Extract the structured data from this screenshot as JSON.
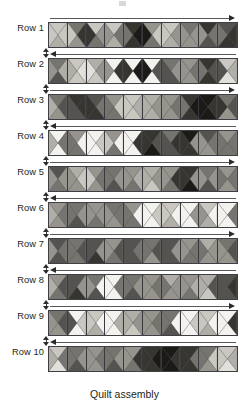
{
  "figure": {
    "caption": "Quilt assembly",
    "rows_count": 10,
    "blocks_per_row": 10,
    "block_type": "quarter-square-triangle-hourglass-x",
    "palette": {
      "white": "#f4f2ee",
      "very_light": "#e2e0da",
      "light": "#c9c7c0",
      "light_mid": "#b0aea7",
      "mid": "#96948d",
      "mid_dark": "#76746f",
      "dark": "#55534f",
      "very_dark": "#37352f",
      "black": "#1b1a17",
      "outline": "#3a3a3e",
      "arrow": "#2b2b2e",
      "text": "#231f20",
      "background": "#ffffff"
    },
    "rows": [
      {
        "label": "Row 1",
        "arrow_direction": "right",
        "blocks": [
          {
            "top": "light",
            "right": "light",
            "bottom": "light_mid",
            "left": "light"
          },
          {
            "top": "mid_dark",
            "right": "very_dark",
            "bottom": "mid",
            "left": "light"
          },
          {
            "top": "light",
            "right": "mid",
            "bottom": "mid_dark",
            "left": "very_dark"
          },
          {
            "top": "light",
            "right": "mid_dark",
            "bottom": "light_mid",
            "left": "mid"
          },
          {
            "top": "very_dark",
            "right": "black",
            "bottom": "very_dark",
            "left": "mid_dark"
          },
          {
            "top": "mid",
            "right": "light",
            "bottom": "mid_dark",
            "left": "black"
          },
          {
            "top": "light",
            "right": "mid",
            "bottom": "light_mid",
            "left": "light"
          },
          {
            "top": "mid_dark",
            "right": "mid",
            "bottom": "mid",
            "left": "mid"
          },
          {
            "top": "very_dark",
            "right": "mid_dark",
            "bottom": "dark",
            "left": "mid"
          },
          {
            "top": "dark",
            "right": "very_dark",
            "bottom": "very_dark",
            "left": "mid_dark"
          }
        ]
      },
      {
        "label": "Row 2",
        "arrow_direction": "left",
        "blocks": [
          {
            "top": "mid_dark",
            "right": "light_mid",
            "bottom": "dark",
            "left": "mid"
          },
          {
            "top": "light",
            "right": "very_light",
            "bottom": "light",
            "left": "light_mid"
          },
          {
            "top": "light_mid",
            "right": "mid",
            "bottom": "light",
            "left": "very_light"
          },
          {
            "top": "white",
            "right": "very_dark",
            "bottom": "white",
            "left": "mid"
          },
          {
            "top": "white",
            "right": "black",
            "bottom": "white",
            "left": "very_dark"
          },
          {
            "top": "white",
            "right": "dark",
            "bottom": "white",
            "left": "black"
          },
          {
            "top": "mid_dark",
            "right": "mid",
            "bottom": "dark",
            "left": "dark"
          },
          {
            "top": "mid",
            "right": "mid_dark",
            "bottom": "mid",
            "left": "mid"
          },
          {
            "top": "very_dark",
            "right": "dark",
            "bottom": "very_dark",
            "left": "mid_dark"
          },
          {
            "top": "light",
            "right": "light_mid",
            "bottom": "very_light",
            "left": "dark"
          }
        ]
      },
      {
        "label": "Row 3",
        "arrow_direction": "right",
        "blocks": [
          {
            "top": "mid_dark",
            "right": "dark",
            "bottom": "mid",
            "left": "light_mid"
          },
          {
            "top": "very_dark",
            "right": "very_dark",
            "bottom": "dark",
            "left": "dark"
          },
          {
            "top": "dark",
            "right": "mid_dark",
            "bottom": "very_dark",
            "left": "very_dark"
          },
          {
            "top": "mid",
            "right": "light",
            "bottom": "mid_dark",
            "left": "mid_dark"
          },
          {
            "top": "light",
            "right": "light_mid",
            "bottom": "light",
            "left": "light"
          },
          {
            "top": "light_mid",
            "right": "mid",
            "bottom": "light_mid",
            "left": "light_mid"
          },
          {
            "top": "mid",
            "right": "mid_dark",
            "bottom": "mid",
            "left": "mid"
          },
          {
            "top": "very_dark",
            "right": "black",
            "bottom": "very_dark",
            "left": "mid_dark"
          },
          {
            "top": "black",
            "right": "very_dark",
            "bottom": "black",
            "left": "black"
          },
          {
            "top": "mid_dark",
            "right": "dark",
            "bottom": "mid",
            "left": "very_dark"
          }
        ]
      },
      {
        "label": "Row 4",
        "arrow_direction": "left",
        "blocks": [
          {
            "top": "white",
            "right": "mid_dark",
            "bottom": "white",
            "left": "light_mid"
          },
          {
            "top": "mid",
            "right": "white",
            "bottom": "mid_dark",
            "left": "mid_dark"
          },
          {
            "top": "white",
            "right": "light",
            "bottom": "white",
            "left": "white"
          },
          {
            "top": "mid",
            "right": "white",
            "bottom": "mid_dark",
            "left": "light"
          },
          {
            "top": "white",
            "right": "very_dark",
            "bottom": "white",
            "left": "white"
          },
          {
            "top": "very_dark",
            "right": "dark",
            "bottom": "black",
            "left": "very_dark"
          },
          {
            "top": "mid_dark",
            "right": "very_dark",
            "bottom": "dark",
            "left": "dark"
          },
          {
            "top": "black",
            "right": "mid",
            "bottom": "very_dark",
            "left": "very_dark"
          },
          {
            "top": "dark",
            "right": "mid_dark",
            "bottom": "mid",
            "left": "mid"
          },
          {
            "top": "mid",
            "right": "mid_dark",
            "bottom": "mid_dark",
            "left": "mid_dark"
          }
        ]
      },
      {
        "label": "Row 5",
        "arrow_direction": "right",
        "blocks": [
          {
            "top": "dark",
            "right": "mid",
            "bottom": "mid_dark",
            "left": "mid"
          },
          {
            "top": "light_mid",
            "right": "light",
            "bottom": "mid",
            "left": "mid"
          },
          {
            "top": "mid",
            "right": "mid_dark",
            "bottom": "mid",
            "left": "light"
          },
          {
            "top": "mid_dark",
            "right": "mid",
            "bottom": "dark",
            "left": "mid_dark"
          },
          {
            "top": "mid",
            "right": "light_mid",
            "bottom": "mid_dark",
            "left": "mid"
          },
          {
            "top": "light_mid",
            "right": "mid",
            "bottom": "light",
            "left": "light_mid"
          },
          {
            "top": "mid",
            "right": "very_dark",
            "bottom": "mid_dark",
            "left": "mid"
          },
          {
            "top": "very_dark",
            "right": "mid",
            "bottom": "black",
            "left": "very_dark"
          },
          {
            "top": "mid_dark",
            "right": "mid",
            "bottom": "dark",
            "left": "mid"
          },
          {
            "top": "mid",
            "right": "mid_dark",
            "bottom": "mid",
            "left": "mid_dark"
          }
        ]
      },
      {
        "label": "Row 6",
        "arrow_direction": "left",
        "blocks": [
          {
            "top": "mid",
            "right": "mid_dark",
            "bottom": "mid",
            "left": "light_mid"
          },
          {
            "top": "mid_dark",
            "right": "mid",
            "bottom": "dark",
            "left": "mid_dark"
          },
          {
            "top": "mid",
            "right": "mid",
            "bottom": "mid_dark",
            "left": "mid"
          },
          {
            "top": "mid_dark",
            "right": "mid_dark",
            "bottom": "mid",
            "left": "mid"
          },
          {
            "top": "mid",
            "right": "white",
            "bottom": "mid_dark",
            "left": "mid_dark"
          },
          {
            "top": "white",
            "right": "light",
            "bottom": "white",
            "left": "white"
          },
          {
            "top": "light",
            "right": "white",
            "bottom": "light_mid",
            "left": "light"
          },
          {
            "top": "white",
            "right": "mid",
            "bottom": "white",
            "left": "white"
          },
          {
            "top": "light",
            "right": "white",
            "bottom": "light_mid",
            "left": "mid"
          },
          {
            "top": "white",
            "right": "mid_dark",
            "bottom": "white",
            "left": "white"
          }
        ]
      },
      {
        "label": "Row 7",
        "arrow_direction": "right",
        "blocks": [
          {
            "top": "dark",
            "right": "mid_dark",
            "bottom": "dark",
            "left": "mid"
          },
          {
            "top": "mid_dark",
            "right": "dark",
            "bottom": "mid_dark",
            "left": "mid_dark"
          },
          {
            "top": "dark",
            "right": "mid",
            "bottom": "very_dark",
            "left": "dark"
          },
          {
            "top": "mid",
            "right": "dark",
            "bottom": "mid_dark",
            "left": "mid"
          },
          {
            "top": "dark",
            "right": "mid_dark",
            "bottom": "dark",
            "left": "dark"
          },
          {
            "top": "mid_dark",
            "right": "dark",
            "bottom": "mid",
            "left": "mid_dark"
          },
          {
            "top": "dark",
            "right": "mid",
            "bottom": "dark",
            "left": "dark"
          },
          {
            "top": "mid",
            "right": "mid_dark",
            "bottom": "mid_dark",
            "left": "mid"
          },
          {
            "top": "light_mid",
            "right": "mid",
            "bottom": "mid",
            "left": "mid_dark"
          },
          {
            "top": "mid_dark",
            "right": "dark",
            "bottom": "mid",
            "left": "mid"
          }
        ]
      },
      {
        "label": "Row 8",
        "arrow_direction": "left",
        "blocks": [
          {
            "top": "mid",
            "right": "dark",
            "bottom": "mid_dark",
            "left": "light_mid"
          },
          {
            "top": "dark",
            "right": "mid",
            "bottom": "very_dark",
            "left": "dark"
          },
          {
            "top": "mid_dark",
            "right": "white",
            "bottom": "dark",
            "left": "mid"
          },
          {
            "top": "white",
            "right": "mid_dark",
            "bottom": "white",
            "left": "white"
          },
          {
            "top": "mid_dark",
            "right": "mid",
            "bottom": "dark",
            "left": "mid_dark"
          },
          {
            "top": "mid",
            "right": "mid_dark",
            "bottom": "mid",
            "left": "mid"
          },
          {
            "top": "light_mid",
            "right": "mid",
            "bottom": "mid",
            "left": "mid_dark"
          },
          {
            "top": "mid",
            "right": "light_mid",
            "bottom": "mid_dark",
            "left": "mid"
          },
          {
            "top": "light_mid",
            "right": "dark",
            "bottom": "light",
            "left": "light_mid"
          },
          {
            "top": "dark",
            "right": "very_dark",
            "bottom": "dark",
            "left": "dark"
          }
        ]
      },
      {
        "label": "Row 9",
        "arrow_direction": "right",
        "blocks": [
          {
            "top": "mid_dark",
            "right": "dark",
            "bottom": "mid",
            "left": "mid"
          },
          {
            "top": "white",
            "right": "light",
            "bottom": "white",
            "left": "dark"
          },
          {
            "top": "light",
            "right": "white",
            "bottom": "light_mid",
            "left": "light"
          },
          {
            "top": "white",
            "right": "light_mid",
            "bottom": "white",
            "left": "white"
          },
          {
            "top": "light_mid",
            "right": "mid",
            "bottom": "light",
            "left": "light_mid"
          },
          {
            "top": "mid",
            "right": "mid_dark",
            "bottom": "mid",
            "left": "mid"
          },
          {
            "top": "mid_dark",
            "right": "white",
            "bottom": "dark",
            "left": "mid_dark"
          },
          {
            "top": "white",
            "right": "light",
            "bottom": "white",
            "left": "white"
          },
          {
            "top": "light",
            "right": "white",
            "bottom": "light_mid",
            "left": "light"
          },
          {
            "top": "white",
            "right": "very_dark",
            "bottom": "white",
            "left": "white"
          }
        ]
      },
      {
        "label": "Row 10",
        "arrow_direction": "left",
        "blocks": [
          {
            "top": "light",
            "right": "mid_dark",
            "bottom": "very_light",
            "left": "light_mid"
          },
          {
            "top": "mid_dark",
            "right": "mid",
            "bottom": "dark",
            "left": "mid_dark"
          },
          {
            "top": "mid",
            "right": "mid_dark",
            "bottom": "mid",
            "left": "mid"
          },
          {
            "top": "mid_dark",
            "right": "mid",
            "bottom": "dark",
            "left": "mid_dark"
          },
          {
            "top": "mid",
            "right": "very_dark",
            "bottom": "mid_dark",
            "left": "mid"
          },
          {
            "top": "very_dark",
            "right": "black",
            "bottom": "very_dark",
            "left": "very_dark"
          },
          {
            "top": "black",
            "right": "very_dark",
            "bottom": "black",
            "left": "black"
          },
          {
            "top": "very_dark",
            "right": "mid_dark",
            "bottom": "very_dark",
            "left": "very_dark"
          },
          {
            "top": "mid_dark",
            "right": "light",
            "bottom": "mid",
            "left": "mid_dark"
          },
          {
            "top": "light",
            "right": "light_mid",
            "bottom": "very_light",
            "left": "light"
          }
        ]
      }
    ]
  }
}
